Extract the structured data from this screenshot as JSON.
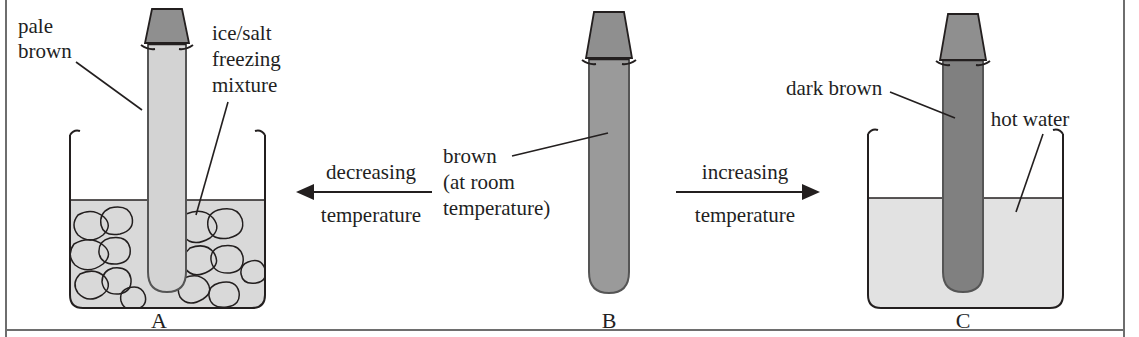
{
  "figure": {
    "width": 1139,
    "height": 337
  },
  "colors": {
    "ink": "#231f1f",
    "frame_rule": "#6e6e6e",
    "stopper": "#8f8f8f",
    "tube_a_fill": "#d3d3d3",
    "tube_b_fill": "#9a9a9a",
    "tube_c_fill": "#808080",
    "ice_bath_fill": "#d9d9d9",
    "hot_water_fill": "#e2e2e2",
    "background": "#ffffff"
  },
  "setups": [
    {
      "id": "a",
      "tube_letter": "A",
      "contents_label": "pale brown",
      "contents_label_lines": [
        "pale",
        "brown"
      ],
      "bath_label": "ice/salt freezing mixture",
      "bath_label_lines": [
        "ice/salt",
        "freezing",
        "mixture"
      ],
      "bath_type": "ice-salt-freezing-mixture",
      "gas_shade": "pale",
      "has_beaker": true
    },
    {
      "id": "b",
      "tube_letter": "B",
      "contents_label": "brown (at room temperature)",
      "contents_label_lines": [
        "brown",
        "(at room",
        "temperature)"
      ],
      "bath_label": "",
      "bath_label_lines": [],
      "bath_type": "none",
      "gas_shade": "medium",
      "has_beaker": false
    },
    {
      "id": "c",
      "tube_letter": "C",
      "contents_label": "dark brown",
      "contents_label_lines": [
        "dark brown"
      ],
      "bath_label": "hot water",
      "bath_label_lines": [
        "hot water"
      ],
      "bath_type": "hot-water",
      "gas_shade": "dark",
      "has_beaker": true
    }
  ],
  "arrows": [
    {
      "id": "decreasing",
      "direction": "left",
      "label_above": "decreasing",
      "label_below": "temperature",
      "label_full": "decreasing temperature"
    },
    {
      "id": "increasing",
      "direction": "right",
      "label_above": "increasing",
      "label_below": "temperature",
      "label_full": "increasing temperature"
    }
  ]
}
